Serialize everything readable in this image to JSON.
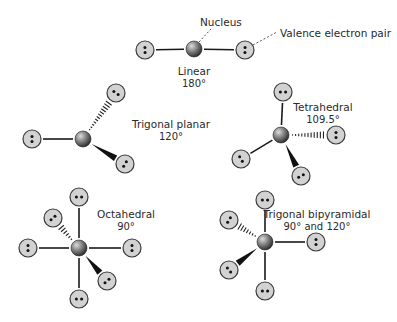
{
  "diagram": {
    "labels": {
      "nucleus": "Nucleus",
      "valence_pair": "Valence electron pair"
    },
    "colors": {
      "nucleus_light": "#c8c8c8",
      "nucleus_dark": "#2e2e2e",
      "pair_fill": "#d2d2d2",
      "pair_stroke": "#3a3a3a",
      "bond": "#1a1a1a",
      "text": "#2a2a2a"
    },
    "geometries": [
      {
        "name": "Linear",
        "angle": "180°",
        "nucleus": [
          194,
          49
        ],
        "pairs": [
          {
            "pos": [
              145,
              50
            ],
            "bond": "plain"
          },
          {
            "pos": [
              245,
              50
            ],
            "bond": "plain"
          }
        ],
        "label_pos": [
          194,
          75
        ],
        "angle_pos": [
          194,
          87
        ]
      },
      {
        "name": "Trigonal planar",
        "angle": "120°",
        "nucleus": [
          83,
          139
        ],
        "pairs": [
          {
            "pos": [
              32,
              139
            ],
            "bond": "plain"
          },
          {
            "pos": [
              116,
              93
            ],
            "bond": "hashed"
          },
          {
            "pos": [
              125,
              164
            ],
            "bond": "wedge"
          }
        ],
        "label_pos": [
          171,
          128
        ],
        "angle_pos": [
          171,
          140
        ]
      },
      {
        "name": "Tetrahedral",
        "angle": "109.5°",
        "nucleus": [
          281,
          135
        ],
        "pairs": [
          {
            "pos": [
              283,
              92
            ],
            "bond": "plain"
          },
          {
            "pos": [
              336,
              135
            ],
            "bond": "hashed"
          },
          {
            "pos": [
              241,
              159
            ],
            "bond": "plain"
          },
          {
            "pos": [
              301,
              176
            ],
            "bond": "wedge"
          }
        ],
        "label_pos": [
          323,
          111
        ],
        "angle_pos": [
          323,
          123
        ]
      },
      {
        "name": "Octahedral",
        "angle": "90°",
        "nucleus": [
          79,
          248
        ],
        "pairs": [
          {
            "pos": [
              79,
              197
            ],
            "bond": "plain"
          },
          {
            "pos": [
              79,
              299
            ],
            "bond": "plain"
          },
          {
            "pos": [
              28,
              248
            ],
            "bond": "plain"
          },
          {
            "pos": [
              132,
              248
            ],
            "bond": "plain"
          },
          {
            "pos": [
              53,
              218
            ],
            "bond": "hashed"
          },
          {
            "pos": [
              107,
              281
            ],
            "bond": "wedge"
          }
        ],
        "label_pos": [
          126,
          218
        ],
        "angle_pos": [
          126,
          230
        ]
      },
      {
        "name": "Trigonal bipyramidal",
        "angle": "90° and 120°",
        "nucleus": [
          265,
          242
        ],
        "pairs": [
          {
            "pos": [
              265,
              200
            ],
            "bond": "plain"
          },
          {
            "pos": [
              265,
              291
            ],
            "bond": "plain"
          },
          {
            "pos": [
              316,
              242
            ],
            "bond": "plain"
          },
          {
            "pos": [
              229,
              220
            ],
            "bond": "hashed"
          },
          {
            "pos": [
              229,
              270
            ],
            "bond": "wedge"
          }
        ],
        "label_pos": [
          317,
          218
        ],
        "angle_pos": [
          317,
          230
        ]
      }
    ]
  }
}
